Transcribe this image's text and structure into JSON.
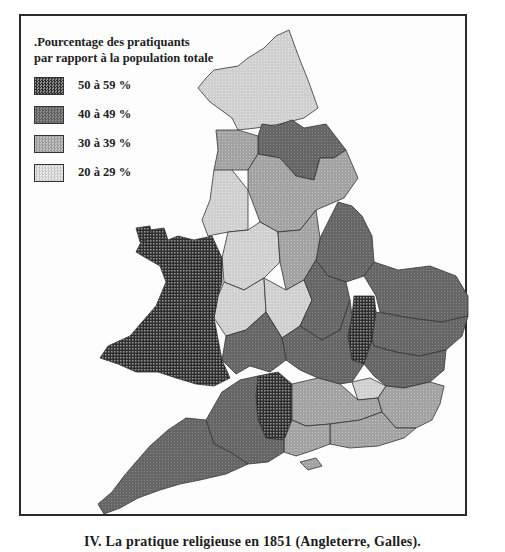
{
  "legend": {
    "title_line1": ".Pourcentage des pratiquants",
    "title_line2": "par rapport à la population totale",
    "items": [
      {
        "label": "50 à 59 %",
        "fill": "#3a3a3a",
        "pattern": "dense-dots"
      },
      {
        "label": "40 à 49 %",
        "fill": "#6e6e6e",
        "pattern": "dark-screen"
      },
      {
        "label": "30 à 39 %",
        "fill": "#a6a6a6",
        "pattern": "medium-screen"
      },
      {
        "label": "20 à 29 %",
        "fill": "#d2d2d2",
        "pattern": "light-screen"
      }
    ]
  },
  "map": {
    "subject": "England and Wales, religious attendance 1851",
    "classes": {
      "Wales": "50 à 59 %",
      "Bedfordshire/Hunts (central-east strip)": "50 à 59 %",
      "Wiltshire": "50 à 59 %",
      "North Yorkshire area": "40 à 49 %",
      "Lincolnshire": "40 à 49 %",
      "East Anglia (Norfolk, Suffolk, Essex)": "40 à 49 %",
      "South-West (Cornwall, Devon, Somerset, Dorset)": "40 à 49 %",
      "Central South (Oxon, Bucks, Herts, Gloucs)": "40 à 49 %",
      "Yorkshire West / Lancashire / Midlands": "30 à 39 %",
      "South-East (Kent, Sussex, Surrey, Hants)": "30 à 39 %",
      "Northumberland / Cumberland / Durham": "20 à 29 %",
      "Lancashire / Cheshire / Staffordshire": "20 à 29 %",
      "Warwick / Leicester area": "20 à 29 %",
      "Middlesex (London)": "20 à 29 %"
    }
  },
  "caption": "IV. La pratique religieuse en 1851 (Angleterre, Galles)."
}
